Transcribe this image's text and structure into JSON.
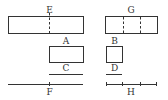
{
  "diagram": {
    "stroke_color": "#333333",
    "background": "#ffffff",
    "rectangles": [
      {
        "id": "E",
        "label": "E",
        "x": 8,
        "y": 16,
        "w": 75,
        "h": 17,
        "dividers": [
          49
        ]
      },
      {
        "id": "G",
        "label": "G",
        "x": 105,
        "y": 16,
        "w": 52,
        "h": 17,
        "dividers": [
          123,
          140
        ]
      },
      {
        "id": "A",
        "label": "A",
        "x": 49,
        "y": 46,
        "w": 34,
        "h": 16,
        "dividers": []
      },
      {
        "id": "B",
        "label": "B",
        "x": 106,
        "y": 46,
        "w": 16,
        "h": 16,
        "dividers": []
      }
    ],
    "segments": [
      {
        "id": "C",
        "label": "C",
        "x1": 49,
        "x2": 83,
        "y": 74,
        "ticks": []
      },
      {
        "id": "D",
        "label": "D",
        "x1": 106,
        "x2": 122,
        "y": 74,
        "ticks": []
      },
      {
        "id": "F",
        "label": "F",
        "x1": 8,
        "x2": 83,
        "y": 84,
        "ticks": [
          49
        ]
      },
      {
        "id": "H",
        "label": "H",
        "x1": 106,
        "x2": 157,
        "y": 84,
        "ticks": [
          106,
          122,
          140,
          157
        ]
      }
    ]
  },
  "labels": {
    "E": "E",
    "G": "G",
    "A": "A",
    "B": "B",
    "C": "C",
    "D": "D",
    "F": "F",
    "H": "H"
  }
}
